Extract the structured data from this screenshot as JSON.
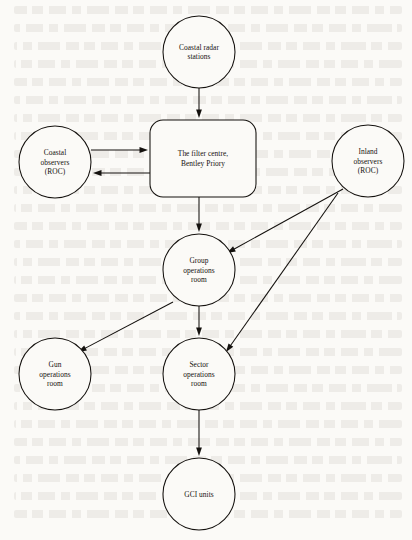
{
  "diagram": {
    "type": "flowchart",
    "nodes": [
      {
        "id": "coastal_radar",
        "shape": "circle",
        "cx": 199,
        "cy": 52,
        "r": 36,
        "lines": [
          "Coastal radar",
          "stations"
        ]
      },
      {
        "id": "coastal_obs",
        "shape": "circle",
        "cx": 55,
        "cy": 162,
        "r": 36,
        "lines": [
          "Coastal",
          "observers",
          "(ROC)"
        ]
      },
      {
        "id": "filter_centre",
        "shape": "roundrect",
        "x": 150,
        "y": 120,
        "w": 106,
        "h": 77,
        "rx": 13,
        "lines": [
          "The filter centre,",
          "Bentley Priory"
        ]
      },
      {
        "id": "inland_obs",
        "shape": "circle",
        "cx": 368,
        "cy": 161,
        "r": 36,
        "lines": [
          "Inland",
          "observers",
          "(ROC)"
        ]
      },
      {
        "id": "group_ops",
        "shape": "circle",
        "cx": 199,
        "cy": 270,
        "r": 36,
        "lines": [
          "Group",
          "operations",
          "room"
        ]
      },
      {
        "id": "gun_ops",
        "shape": "circle",
        "cx": 55,
        "cy": 374,
        "r": 36,
        "lines": [
          "Gun",
          "operations",
          "room"
        ]
      },
      {
        "id": "sector_ops",
        "shape": "circle",
        "cx": 199,
        "cy": 374,
        "r": 36,
        "lines": [
          "Sector",
          "operations",
          "room"
        ]
      },
      {
        "id": "gci_units",
        "shape": "circle",
        "cx": 199,
        "cy": 494,
        "r": 36,
        "lines": [
          "GCI units"
        ]
      }
    ],
    "edges": [
      {
        "id": "radar_to_filter",
        "from": "coastal_radar",
        "to": "filter_centre",
        "x1": 199,
        "y1": 88,
        "x2": 199,
        "y2": 118,
        "arrow": "end"
      },
      {
        "id": "coastal_to_filter",
        "from": "coastal_obs",
        "to": "filter_centre",
        "x1": 91,
        "y1": 150,
        "x2": 148,
        "y2": 150,
        "arrow": "end"
      },
      {
        "id": "filter_to_coastal",
        "from": "filter_centre",
        "to": "coastal_obs",
        "x1": 150,
        "y1": 173,
        "x2": 93,
        "y2": 173,
        "arrow": "end"
      },
      {
        "id": "filter_to_group",
        "from": "filter_centre",
        "to": "group_ops",
        "x1": 199,
        "y1": 197,
        "x2": 199,
        "y2": 232,
        "arrow": "end"
      },
      {
        "id": "inland_to_group",
        "from": "inland_obs",
        "to": "group_ops",
        "x1": 343,
        "y1": 189,
        "x2": 227,
        "y2": 253,
        "arrow": "end"
      },
      {
        "id": "inland_to_sector",
        "from": "inland_obs",
        "to": "sector_ops",
        "x1": 338,
        "y1": 193,
        "x2": 226,
        "y2": 352,
        "arrow": "end"
      },
      {
        "id": "group_to_gun",
        "from": "group_ops",
        "to": "gun_ops",
        "x1": 173,
        "y1": 302,
        "x2": 78,
        "y2": 352,
        "arrow": "end"
      },
      {
        "id": "group_to_sector",
        "from": "group_ops",
        "to": "sector_ops",
        "x1": 199,
        "y1": 306,
        "x2": 199,
        "y2": 336,
        "arrow": "end"
      },
      {
        "id": "sector_to_gci",
        "from": "sector_ops",
        "to": "gci_units",
        "x1": 199,
        "y1": 410,
        "x2": 199,
        "y2": 456,
        "arrow": "end"
      }
    ],
    "colors": {
      "paper": "#fbfaf7",
      "ink": "#14110e"
    }
  }
}
